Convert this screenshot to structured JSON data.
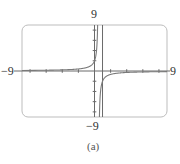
{
  "chart_data": {
    "type": "line",
    "title": "",
    "caption": "(a)",
    "function": "y = -1/(x - 0.5)",
    "vertical_asymptote": 0.5,
    "horizontal_asymptote": 0,
    "xlim": [
      -9,
      9
    ],
    "ylim": [
      -9,
      9
    ],
    "x_tick_step": 2,
    "y_tick_step": 2,
    "grid": false,
    "xlabel": "",
    "ylabel": "",
    "window_labels": {
      "ymax": "9",
      "ymin": "−9",
      "xmin": "−9",
      "xmax": "9"
    },
    "colors": {
      "frame": "#bdbdbd",
      "axes": "#6a6a6a",
      "curve": "#7a7a7a",
      "asymptote": "#6a6a6a"
    }
  }
}
